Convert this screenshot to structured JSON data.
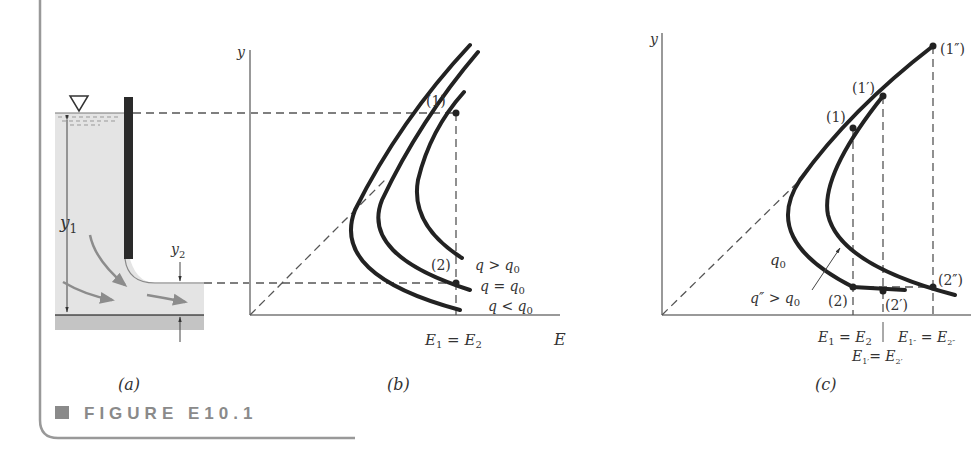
{
  "figure": {
    "caption": "FIGURE E10.1",
    "caption_marker_color": "#8a8a8a",
    "frame_color": "#999999"
  },
  "panel_a": {
    "label": "(a)",
    "upstream_depth_label": "y",
    "upstream_depth_sub": "1",
    "downstream_depth_label": "y",
    "downstream_depth_sub": "2",
    "water_color": "#e4e4e4",
    "bed_color": "#c4c4c4",
    "gate_color": "#2a2a2a",
    "free_surface_symbol": "▽"
  },
  "panel_b": {
    "label": "(b)",
    "y_axis_label": "y",
    "x_axis_label": "E",
    "point_1": "(1)",
    "point_2": "(2)",
    "curves": [
      {
        "label": "q > q",
        "sub": "0"
      },
      {
        "label": "q = q",
        "sub": "0"
      },
      {
        "label": "q < q",
        "sub": "0"
      }
    ],
    "energy_eq": {
      "lhs": "E",
      "lhs_sub": "1",
      "eq": " = ",
      "rhs": "E",
      "rhs_sub": "2"
    }
  },
  "panel_c": {
    "label": "(c)",
    "y_axis_label": "y",
    "points": {
      "p1": "(1)",
      "p1p": "(1′)",
      "p1pp": "(1″)",
      "p2": "(2)",
      "p2p": "(2′)",
      "p2pp": "(2″)"
    },
    "curve_q0": {
      "label": "q",
      "sub": "0"
    },
    "curve_qpp": {
      "label": "q″ > q",
      "sub": "0"
    },
    "energy_eq_1": {
      "lhs": "E",
      "lhs_sub": "1",
      "eq": " = ",
      "rhs": "E",
      "rhs_sub": "2"
    },
    "energy_eq_pp": {
      "lhs": "E",
      "lhs_sub": "1″",
      "eq": " = ",
      "rhs": "E",
      "rhs_sub": "2″"
    },
    "energy_eq_p": {
      "lhs": "E",
      "lhs_sub": "1′",
      "eq": "= ",
      "rhs": "E",
      "rhs_sub": "2′"
    }
  }
}
